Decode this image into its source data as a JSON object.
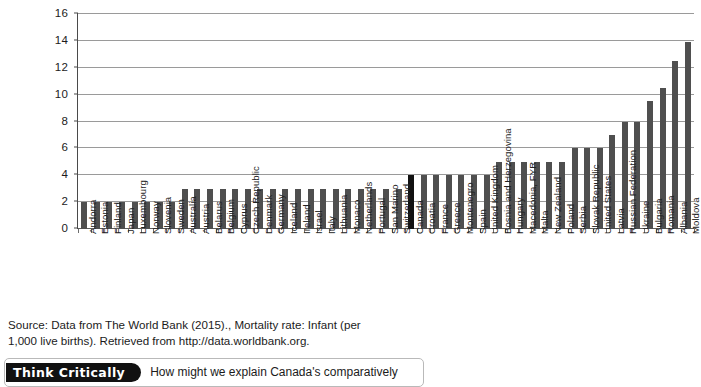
{
  "chart_data": {
    "type": "bar",
    "title": "",
    "subtitle": "",
    "xlabel": "",
    "ylabel": "",
    "ylim": [
      0,
      16
    ],
    "ytick_values": [
      0,
      2,
      4,
      6,
      8,
      10,
      12,
      14,
      16
    ],
    "ytick_labels": [
      "0",
      "2",
      "4",
      "6",
      "8",
      "10",
      "12",
      "14",
      "16"
    ],
    "grid": true,
    "legend": "none",
    "highlight_category": "Canada",
    "highlight_color": "#111111",
    "bar_color": "#4f4f4f",
    "categories": [
      "Andorra",
      "Estonia",
      "Finland",
      "Japan",
      "Luxembourg",
      "Norway",
      "Slovenia",
      "Sweden",
      "Australia",
      "Austria",
      "Belarus",
      "Belgium",
      "Cyprus",
      "Czech Republic",
      "Denmark",
      "Germany",
      "Iceland",
      "Ireland",
      "Israel",
      "Italy",
      "Lithuania",
      "Monaco",
      "Netherlands",
      "Portugal",
      "San Marino",
      "Switzerland",
      "Canada",
      "Croatia",
      "France",
      "Greece",
      "Montenegro",
      "Spain",
      "United Kingdom",
      "Bosnia and Herzegovina",
      "Hungary",
      "Macedonia, FYR",
      "Malta",
      "New Zealand",
      "Poland",
      "Serbia",
      "Slovak Republic",
      "United States",
      "Latvia",
      "Russian Federation",
      "Ukraine",
      "Bulgaria",
      "Romania",
      "Albania",
      "Moldova"
    ],
    "values": [
      2,
      2,
      2,
      2,
      2,
      2,
      2,
      2,
      3,
      3,
      3,
      3,
      3,
      3,
      3,
      3,
      3,
      3,
      3,
      3,
      3,
      3,
      3,
      3,
      3,
      3,
      4,
      4,
      4,
      4,
      4,
      4,
      4,
      5,
      5,
      5,
      5,
      5,
      5,
      6,
      6,
      6,
      7,
      8,
      8,
      9.5,
      10.5,
      12.5,
      13.9
    ]
  },
  "source_note": {
    "line1": "Source: Data from The World Bank (2015)., Mortality rate: Infant (per",
    "line2": "1,000 live births). Retrieved from http://data.worldbank.org."
  },
  "think_critically": {
    "badge_label": "Think Critically",
    "question": "How might we explain Canada's comparatively"
  }
}
